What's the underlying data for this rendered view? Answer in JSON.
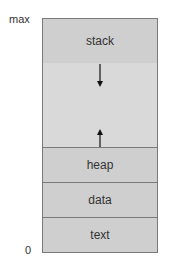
{
  "axis": {
    "top_label": "max",
    "bottom_label": "0"
  },
  "segments": {
    "stack": "stack",
    "heap": "heap",
    "data": "data",
    "text": "text"
  },
  "arrows": [
    {
      "from": "stack",
      "direction": "down"
    },
    {
      "from": "heap",
      "direction": "up"
    }
  ],
  "colors": {
    "segment_fill": "#cfcfcf",
    "free_space_fill": "#d9d9d9",
    "border": "#7a7a7a"
  }
}
